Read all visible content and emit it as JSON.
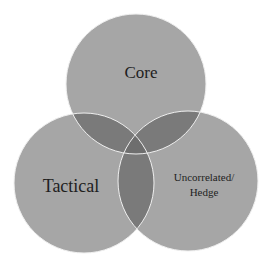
{
  "diagram": {
    "type": "venn",
    "sets": [
      {
        "id": "core",
        "label": "Core",
        "cx": 136,
        "cy": 84,
        "r": 70
      },
      {
        "id": "tactical",
        "label": "Tactical",
        "cx": 84,
        "cy": 183,
        "r": 70
      },
      {
        "id": "uncorrelated",
        "label_line1": "Uncorrelated/",
        "label_line2": "Hedge",
        "cx": 188,
        "cy": 181,
        "r": 70
      }
    ],
    "colors": {
      "background": "#ffffff",
      "circle_fill": "#a6a6a6",
      "overlap_fill": "#7a7a7a",
      "center_fill": "#6a6a6a",
      "outline": "#f2f2f2",
      "text": "#1e1e1e"
    }
  }
}
